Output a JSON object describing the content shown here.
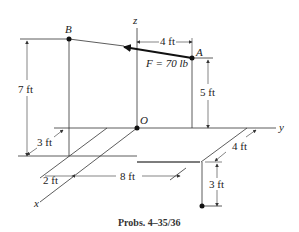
{
  "diagram": {
    "caption": "Probs. 4–35/36",
    "axes": {
      "x": "x",
      "y": "y",
      "z": "z"
    },
    "origin_label": "O",
    "points": {
      "A": "A",
      "B": "B"
    },
    "force": {
      "label": "F = 70 lb",
      "name": "F",
      "magnitude": "70 lb"
    },
    "dimensions": {
      "ab_horizontal": "4 ft",
      "a_height": "5 ft",
      "b_height": "7 ft",
      "b_offset_x": "3 ft",
      "x_offset": "2 ft",
      "y_distance": "8 ft",
      "c_offset": "4 ft",
      "c_depth": "3 ft"
    }
  }
}
